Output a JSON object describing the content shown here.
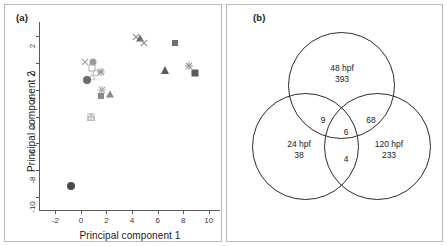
{
  "figure": {
    "panel_a_label": "(a)",
    "panel_b_label": "(b)"
  },
  "chart_data": [
    {
      "type": "scatter",
      "panel": "(a)",
      "title": "",
      "xlabel": "Principal component 1",
      "ylabel": "Principal component 2",
      "xlim": [
        -3.2,
        10.8
      ],
      "ylim": [
        -11.0,
        3.0
      ],
      "xticks": [
        -2,
        0,
        2,
        4,
        6,
        8,
        10
      ],
      "xticklabels": [
        "-2",
        "0",
        "2",
        "4",
        "6",
        "8",
        "10"
      ],
      "yticks": [
        2,
        0,
        -2,
        -4,
        -6,
        -8,
        -10
      ],
      "yticklabels": [
        "2",
        "0",
        "-2",
        "-4",
        "-6",
        "-8",
        "-10"
      ],
      "grid": false,
      "legend": "none",
      "points": [
        {
          "x": 4.3,
          "y": 1.95,
          "marker": "x",
          "color": "#8c8c8c",
          "size": 8
        },
        {
          "x": 4.65,
          "y": 1.85,
          "marker": "triangle",
          "color": "#6e6e6e",
          "size": 7
        },
        {
          "x": 4.9,
          "y": 1.5,
          "marker": "x",
          "color": "#8c8c8c",
          "size": 8
        },
        {
          "x": 7.35,
          "y": 1.5,
          "marker": "square",
          "color": "#6e6e6e",
          "size": 6
        },
        {
          "x": 8.45,
          "y": -0.2,
          "marker": "star",
          "color": "#8f8f8f",
          "size": 9
        },
        {
          "x": 6.55,
          "y": -0.5,
          "marker": "triangle",
          "color": "#5a5a5a",
          "size": 8
        },
        {
          "x": 8.95,
          "y": -0.75,
          "marker": "square",
          "color": "#5a5a5a",
          "size": 7
        },
        {
          "x": 0.3,
          "y": 0.05,
          "marker": "x",
          "color": "#a0a0a0",
          "size": 8
        },
        {
          "x": 0.95,
          "y": 0.1,
          "marker": "circle",
          "color": "#9a9a9a",
          "size": 7
        },
        {
          "x": 0.9,
          "y": -0.35,
          "marker": "open-square",
          "color": "#b0b0b0",
          "size": 7
        },
        {
          "x": 0.85,
          "y": -0.5,
          "marker": "open-tri",
          "color": "#b0b0b0",
          "size": 7
        },
        {
          "x": 1.2,
          "y": -0.75,
          "marker": "open-circle",
          "color": "#b5b5b5",
          "size": 7
        },
        {
          "x": 1.6,
          "y": -0.7,
          "marker": "star",
          "color": "#8f8f8f",
          "size": 9
        },
        {
          "x": 0.45,
          "y": -1.25,
          "marker": "circle",
          "color": "#6a6a6a",
          "size": 8
        },
        {
          "x": 1.65,
          "y": -2.0,
          "marker": "star",
          "color": "#a5a5a5",
          "size": 9
        },
        {
          "x": 1.55,
          "y": -2.45,
          "marker": "square",
          "color": "#8a8a8a",
          "size": 6
        },
        {
          "x": 2.25,
          "y": -2.35,
          "marker": "triangle",
          "color": "#8a8a8a",
          "size": 7
        },
        {
          "x": 0.75,
          "y": -3.65,
          "marker": "open-star",
          "color": "#b2b2b2",
          "size": 9
        },
        {
          "x": -0.8,
          "y": -9.2,
          "marker": "circle",
          "color": "#4a4a4a",
          "size": 8
        }
      ]
    },
    {
      "type": "venn",
      "panel": "(b)",
      "sets": [
        {
          "label": "48 hpf",
          "count": "393",
          "position": "top"
        },
        {
          "label": "24 hpf",
          "count": "38",
          "position": "bottom-left"
        },
        {
          "label": "120 hpf",
          "count": "233",
          "position": "bottom-right"
        }
      ],
      "intersections": [
        {
          "label": "48 hpf ∩ 24 hpf",
          "count": "9"
        },
        {
          "label": "48 hpf ∩ 120 hpf",
          "count": "68"
        },
        {
          "label": "24 hpf ∩ 120 hpf",
          "count": "4"
        },
        {
          "label": "48 hpf ∩ 24 hpf ∩ 120 hpf",
          "count": "6"
        }
      ]
    }
  ],
  "panel_a": {
    "xlabel": "Principal component 1",
    "ylabel": "Principal component 2",
    "xticklabels": [
      "-2",
      "0",
      "2",
      "4",
      "6",
      "8",
      "10"
    ],
    "yticklabels": [
      "2",
      "0",
      "-2",
      "-4",
      "-6",
      "-8",
      "-10"
    ]
  },
  "panel_b": {
    "top_label": "48 hpf",
    "top_count": "393",
    "left_label": "24 hpf",
    "left_count": "38",
    "right_label": "120 hpf",
    "right_count": "233",
    "int_top_left": "9",
    "int_top_right": "68",
    "int_center": "6",
    "int_bottom": "4"
  }
}
